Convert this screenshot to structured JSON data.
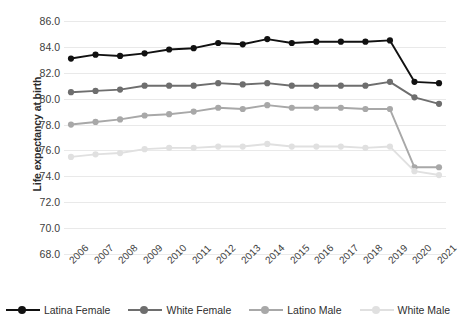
{
  "chart_data": {
    "type": "line",
    "title": "",
    "xlabel": "",
    "ylabel": "Life expectancy at birth",
    "categories": [
      "2006",
      "2007",
      "2008",
      "2009",
      "2010",
      "2011",
      "2012",
      "2013",
      "2014",
      "2015",
      "2016",
      "2017",
      "2018",
      "2019",
      "2020",
      "2021"
    ],
    "ylim": [
      68.0,
      86.0
    ],
    "ytick_step": 2.0,
    "yticks": [
      "86.0",
      "84.0",
      "82.0",
      "80.0",
      "78.0",
      "76.0",
      "74.0",
      "72.0",
      "70.0",
      "68.0"
    ],
    "grid": true,
    "legend_position": "bottom",
    "series": [
      {
        "name": "Latina Female",
        "color": "#111111",
        "values": [
          83.1,
          83.4,
          83.3,
          83.5,
          83.8,
          83.9,
          84.3,
          84.2,
          84.6,
          84.3,
          84.4,
          84.4,
          84.4,
          84.5,
          81.3,
          81.2
        ]
      },
      {
        "name": "White Female",
        "color": "#6e6e6e",
        "values": [
          80.5,
          80.6,
          80.7,
          81.0,
          81.0,
          81.0,
          81.2,
          81.1,
          81.2,
          81.0,
          81.0,
          81.0,
          81.0,
          81.3,
          80.1,
          79.6
        ]
      },
      {
        "name": "Latino Male",
        "color": "#a8a8a8",
        "values": [
          78.0,
          78.2,
          78.4,
          78.7,
          78.8,
          79.0,
          79.3,
          79.2,
          79.5,
          79.3,
          79.3,
          79.3,
          79.2,
          79.2,
          74.7,
          74.7
        ]
      },
      {
        "name": "White Male",
        "color": "#e0e0e0",
        "values": [
          75.5,
          75.7,
          75.8,
          76.1,
          76.2,
          76.2,
          76.3,
          76.3,
          76.5,
          76.3,
          76.3,
          76.3,
          76.2,
          76.3,
          74.4,
          74.1
        ]
      }
    ]
  }
}
